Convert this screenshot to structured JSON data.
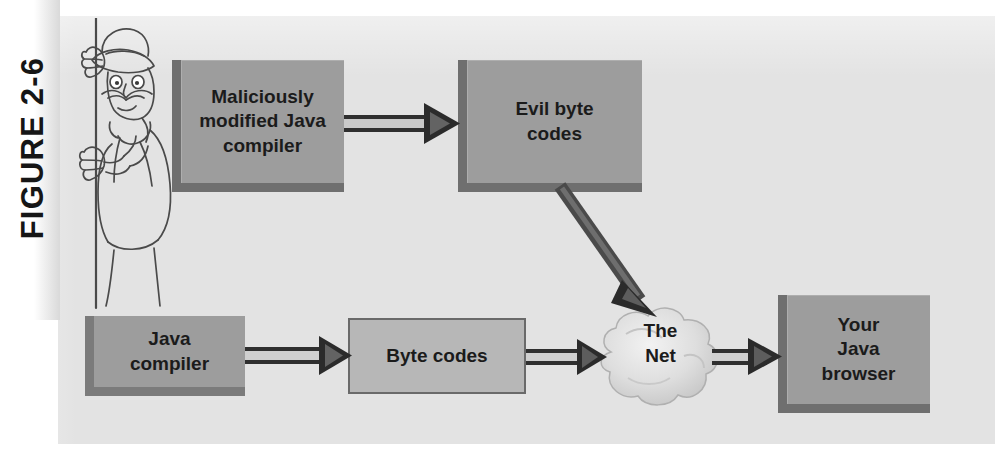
{
  "figure": {
    "label": "FIGURE 2-6",
    "caption_text": "FIGURE 2-6"
  },
  "colors": {
    "panel_background": "#e3e3e3",
    "page_background": "#ffffff",
    "box_fill": "#9d9d9d",
    "box_fill_light": "#b7b7b7",
    "box_edge_dark": "#6f6f6f",
    "ink": "#1b1b1b",
    "arrow_dark": "#3a3a3a",
    "cloud_fill": "#d8d8d8"
  },
  "diagram": {
    "type": "flow-diagram",
    "title": "FIGURE 2-6",
    "nodes": [
      {
        "id": "bad-compiler",
        "label": "Maliciously\nmodified Java\ncompiler",
        "shape": "box-3d",
        "row": "top"
      },
      {
        "id": "evil-bytes",
        "label": "Evil byte\ncodes",
        "shape": "box-3d",
        "row": "top"
      },
      {
        "id": "java-compiler",
        "label": "Java\ncompiler",
        "shape": "box-3d",
        "row": "bottom"
      },
      {
        "id": "byte-codes",
        "label": "Byte codes",
        "shape": "box-flat",
        "row": "bottom"
      },
      {
        "id": "the-net",
        "label": "The\nNet",
        "shape": "cloud",
        "row": "bottom"
      },
      {
        "id": "browser",
        "label": "Your\nJava\nbrowser",
        "shape": "box-3d",
        "row": "bottom"
      }
    ],
    "edges": [
      {
        "from": "bad-compiler",
        "to": "evil-bytes",
        "style": "hollow-arrow",
        "direction": "right"
      },
      {
        "from": "evil-bytes",
        "to": "the-net",
        "style": "solid-arrow",
        "direction": "down-right"
      },
      {
        "from": "java-compiler",
        "to": "byte-codes",
        "style": "hollow-arrow",
        "direction": "right"
      },
      {
        "from": "byte-codes",
        "to": "the-net",
        "style": "hollow-arrow",
        "direction": "right"
      },
      {
        "from": "the-net",
        "to": "browser",
        "style": "hollow-arrow",
        "direction": "right"
      }
    ],
    "illustration": {
      "name": "sneaky-spy-cartoon",
      "description": "Cartoon man in hat and trench coat with mustache peeking from behind a pole"
    }
  },
  "labels": {
    "bad_compiler_line1": "Maliciously",
    "bad_compiler_line2": "modified Java",
    "bad_compiler_line3": "compiler",
    "evil_bytes_line1": "Evil byte",
    "evil_bytes_line2": "codes",
    "java_compiler_line1": "Java",
    "java_compiler_line2": "compiler",
    "byte_codes": "Byte codes",
    "the_net_line1": "The",
    "the_net_line2": "Net",
    "browser_line1": "Your",
    "browser_line2": "Java",
    "browser_line3": "browser"
  }
}
